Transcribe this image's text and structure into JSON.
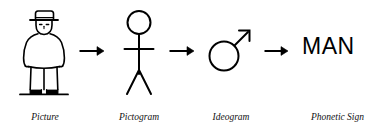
{
  "diagram": {
    "background_color": "#ffffff",
    "ink_color": "#000000",
    "stages": [
      {
        "id": "picture",
        "caption": "Picture",
        "icon": "standing-man-with-hat-drawing",
        "description": "Detailed line drawing of a man wearing a hat, coat and trousers standing on a ground line"
      },
      {
        "id": "pictogram",
        "caption": "Pictogram",
        "icon": "stick-figure",
        "description": "Simplified stick figure with circular head, straight arms and splayed legs"
      },
      {
        "id": "ideogram",
        "caption": "Ideogram",
        "icon": "mars-symbol",
        "symbol": "♂",
        "description": "Mars / male symbol: circle with arrow pointing to upper right"
      },
      {
        "id": "phonetic-sign",
        "caption": "Phonetic Sign",
        "icon": "text-word",
        "text": "MAN",
        "description": "The word MAN written in capital sans-serif letters"
      }
    ],
    "connectors": [
      {
        "id": "arrow-1",
        "from": "picture",
        "to": "pictogram",
        "icon": "arrow-right-icon"
      },
      {
        "id": "arrow-2",
        "from": "pictogram",
        "to": "ideogram",
        "icon": "arrow-right-icon"
      },
      {
        "id": "arrow-3",
        "from": "ideogram",
        "to": "phonetic-sign",
        "icon": "arrow-right-icon"
      }
    ]
  }
}
